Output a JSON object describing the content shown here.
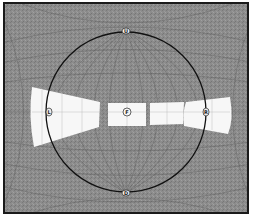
{
  "diagram": {
    "type": "visual-field-projection",
    "colors": {
      "background": "#8a8a8a",
      "grid": "#5e5e5e",
      "field": "#f7f7f7",
      "circle": "#111111",
      "frame": "#1a1a1a"
    },
    "markers": [
      {
        "id": "top",
        "label": "U",
        "x": 124,
        "y": 28
      },
      {
        "id": "bottom",
        "label": "D",
        "x": 124,
        "y": 191
      },
      {
        "id": "left",
        "label": "L",
        "x": 48,
        "y": 110
      },
      {
        "id": "center",
        "label": "F",
        "x": 125,
        "y": 110
      },
      {
        "id": "right",
        "label": "R",
        "x": 203,
        "y": 110
      }
    ]
  }
}
